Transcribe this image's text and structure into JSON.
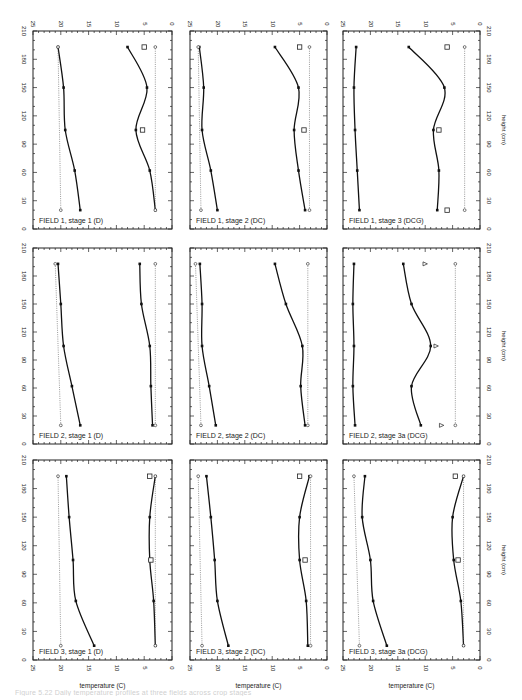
{
  "figure": {
    "caption": "Figure 5.22 Daily temperature profiles at three fields across crop stages",
    "orientation": "rotated 90° counter-clockwise",
    "axes": {
      "temperature_label": "temperature (C)",
      "height_label": "height (cm)",
      "temperature_ticks": [
        25,
        20,
        15,
        10,
        5,
        0
      ],
      "height_ticks": [
        0,
        30,
        60,
        90,
        120,
        150,
        180,
        210
      ]
    }
  },
  "chart_data": [
    {
      "type": "line",
      "title": "FIELD 1, stage 1 (D)",
      "xlabel": "height (cm)",
      "ylabel": "temperature (C)",
      "xlim": [
        0,
        210
      ],
      "ylim": [
        0,
        25
      ],
      "series": [
        {
          "name": "upper profile",
          "x": [
            20,
            62,
            105,
            150,
            193
          ],
          "y": [
            16.5,
            17.5,
            19.2,
            19.5,
            20.5
          ]
        },
        {
          "name": "lower profile",
          "x": [
            20,
            62,
            105,
            150,
            193
          ],
          "y": [
            3.0,
            4.0,
            6.5,
            4.5,
            8.0
          ]
        },
        {
          "name": "reference upper (dotted)",
          "x": [
            20,
            193
          ],
          "y": [
            20.0,
            20.5
          ]
        },
        {
          "name": "reference lower (dotted)",
          "x": [
            20,
            193
          ],
          "y": [
            3.0,
            3.0
          ]
        }
      ],
      "markers": [
        {
          "x": 193,
          "y": 5.0,
          "symbol": "square"
        },
        {
          "x": 105,
          "y": 5.3,
          "symbol": "square"
        }
      ]
    },
    {
      "type": "line",
      "title": "FIELD 1, stage 2 (DC)",
      "xlabel": "height (cm)",
      "ylabel": "temperature (C)",
      "xlim": [
        0,
        210
      ],
      "ylim": [
        0,
        25
      ],
      "series": [
        {
          "name": "upper profile",
          "x": [
            20,
            62,
            105,
            150,
            193
          ],
          "y": [
            20.0,
            21.2,
            22.8,
            22.5,
            23.3
          ]
        },
        {
          "name": "lower profile",
          "x": [
            20,
            62,
            105,
            150,
            193
          ],
          "y": [
            4.0,
            5.2,
            6.0,
            5.2,
            9.5
          ]
        },
        {
          "name": "reference upper (dotted)",
          "x": [
            20,
            193
          ],
          "y": [
            23.0,
            23.5
          ]
        },
        {
          "name": "reference lower (dotted)",
          "x": [
            20,
            193
          ],
          "y": [
            3.2,
            3.2
          ]
        }
      ],
      "markers": [
        {
          "x": 193,
          "y": 5.0,
          "symbol": "square"
        },
        {
          "x": 105,
          "y": 4.2,
          "symbol": "square"
        }
      ]
    },
    {
      "type": "line",
      "title": "FIELD 1, stage 3 (DCG)",
      "xlabel": "height (cm)",
      "ylabel": "temperature (C)",
      "xlim": [
        0,
        210
      ],
      "ylim": [
        0,
        25
      ],
      "series": [
        {
          "name": "upper profile",
          "x": [
            20,
            62,
            105,
            150,
            193
          ],
          "y": [
            22.0,
            22.4,
            22.8,
            23.0,
            22.6
          ]
        },
        {
          "name": "lower profile",
          "x": [
            20,
            62,
            105,
            150,
            193
          ],
          "y": [
            7.8,
            7.5,
            8.5,
            6.5,
            13.0
          ]
        },
        {
          "name": "reference lower (dotted)",
          "x": [
            20,
            193
          ],
          "y": [
            2.8,
            2.8
          ]
        }
      ],
      "markers": [
        {
          "x": 193,
          "y": 6.0,
          "symbol": "square"
        },
        {
          "x": 105,
          "y": 7.5,
          "symbol": "square"
        },
        {
          "x": 20,
          "y": 6.0,
          "symbol": "square"
        }
      ]
    },
    {
      "type": "line",
      "title": "FIELD 2, stage 1 (D)",
      "xlabel": "height (cm)",
      "ylabel": "temperature (C)",
      "xlim": [
        0,
        210
      ],
      "ylim": [
        0,
        25
      ],
      "series": [
        {
          "name": "upper profile",
          "x": [
            20,
            62,
            105,
            150,
            193
          ],
          "y": [
            16.5,
            18.0,
            19.5,
            20.0,
            20.5
          ]
        },
        {
          "name": "lower profile",
          "x": [
            20,
            62,
            105,
            150,
            193
          ],
          "y": [
            3.5,
            3.8,
            4.0,
            5.5,
            5.8
          ]
        },
        {
          "name": "reference upper (dotted)",
          "x": [
            20,
            193
          ],
          "y": [
            20.0,
            21.0
          ]
        },
        {
          "name": "reference lower (dotted)",
          "x": [
            20,
            193
          ],
          "y": [
            3.0,
            3.0
          ]
        }
      ]
    },
    {
      "type": "line",
      "title": "FIELD 2, stage 2 (DC)",
      "xlabel": "height (cm)",
      "ylabel": "temperature (C)",
      "xlim": [
        0,
        210
      ],
      "ylim": [
        0,
        25
      ],
      "series": [
        {
          "name": "upper profile",
          "x": [
            20,
            62,
            105,
            150,
            193
          ],
          "y": [
            20.3,
            21.5,
            22.8,
            22.8,
            23.2
          ]
        },
        {
          "name": "lower profile",
          "x": [
            20,
            62,
            105,
            150,
            193
          ],
          "y": [
            4.0,
            4.8,
            4.5,
            7.5,
            9.5
          ]
        },
        {
          "name": "reference upper (dotted)",
          "x": [
            20,
            193
          ],
          "y": [
            23.0,
            24.0
          ]
        },
        {
          "name": "reference lower (dotted)",
          "x": [
            20,
            193
          ],
          "y": [
            3.5,
            3.5
          ]
        }
      ]
    },
    {
      "type": "line",
      "title": "FIELD 2, stage 3a (DCG)",
      "xlabel": "height (cm)",
      "ylabel": "temperature (C)",
      "xlim": [
        0,
        210
      ],
      "ylim": [
        0,
        25
      ],
      "series": [
        {
          "name": "upper profile",
          "x": [
            20,
            62,
            105,
            150,
            193
          ],
          "y": [
            22.8,
            23.2,
            23.0,
            23.2,
            23.0
          ]
        },
        {
          "name": "lower profile",
          "x": [
            20,
            62,
            105,
            150,
            193
          ],
          "y": [
            10.8,
            12.5,
            9.0,
            12.5,
            14.0
          ]
        },
        {
          "name": "reference lower (dotted)",
          "x": [
            20,
            193
          ],
          "y": [
            4.5,
            4.5
          ]
        }
      ],
      "markers": [
        {
          "x": 193,
          "y": 10.0,
          "symbol": "triangle"
        },
        {
          "x": 105,
          "y": 8.0,
          "symbol": "triangle"
        },
        {
          "x": 20,
          "y": 7.0,
          "symbol": "triangle"
        }
      ]
    },
    {
      "type": "line",
      "title": "FIELD 3, stage 1 (D)",
      "xlabel": "height (cm)",
      "ylabel": "temperature (C)",
      "xlim": [
        0,
        210
      ],
      "ylim": [
        0,
        25
      ],
      "series": [
        {
          "name": "upper profile",
          "x": [
            15,
            62,
            105,
            150,
            193
          ],
          "y": [
            14.0,
            17.3,
            17.8,
            18.5,
            19.0
          ]
        },
        {
          "name": "lower profile",
          "x": [
            15,
            62,
            105,
            150,
            193
          ],
          "y": [
            3.0,
            3.3,
            4.0,
            4.0,
            3.0
          ]
        },
        {
          "name": "reference upper (dotted)",
          "x": [
            15,
            193
          ],
          "y": [
            20.0,
            20.5
          ]
        },
        {
          "name": "reference lower (dotted)",
          "x": [
            15,
            193
          ],
          "y": [
            3.0,
            3.0
          ]
        }
      ],
      "markers": [
        {
          "x": 193,
          "y": 4.0,
          "symbol": "square"
        },
        {
          "x": 105,
          "y": 3.8,
          "symbol": "square"
        }
      ]
    },
    {
      "type": "line",
      "title": "FIELD 3, stage 2 (DC)",
      "xlabel": "height (cm)",
      "ylabel": "temperature (C)",
      "xlim": [
        0,
        210
      ],
      "ylim": [
        0,
        25
      ],
      "series": [
        {
          "name": "upper profile",
          "x": [
            15,
            62,
            105,
            150,
            193
          ],
          "y": [
            18.0,
            20.0,
            20.5,
            21.2,
            22.0
          ]
        },
        {
          "name": "lower profile",
          "x": [
            15,
            62,
            105,
            150,
            193
          ],
          "y": [
            3.5,
            3.8,
            5.0,
            5.0,
            3.2
          ]
        },
        {
          "name": "reference upper (dotted)",
          "x": [
            15,
            193
          ],
          "y": [
            22.8,
            23.5
          ]
        },
        {
          "name": "reference lower (dotted)",
          "x": [
            15,
            193
          ],
          "y": [
            3.0,
            3.0
          ]
        }
      ],
      "markers": [
        {
          "x": 193,
          "y": 5.0,
          "symbol": "square"
        },
        {
          "x": 105,
          "y": 4.0,
          "symbol": "square"
        }
      ]
    },
    {
      "type": "line",
      "title": "FIELD 3, stage 3a (DCG)",
      "xlabel": "height (cm)",
      "ylabel": "temperature (C)",
      "xlim": [
        0,
        210
      ],
      "ylim": [
        0,
        25
      ],
      "series": [
        {
          "name": "upper profile",
          "x": [
            15,
            62,
            105,
            150,
            193
          ],
          "y": [
            17.0,
            19.5,
            20.0,
            21.5,
            21.0
          ]
        },
        {
          "name": "lower profile",
          "x": [
            15,
            62,
            105,
            150,
            193
          ],
          "y": [
            3.0,
            3.5,
            4.8,
            5.0,
            3.0
          ]
        },
        {
          "name": "reference upper (dotted)",
          "x": [
            15,
            193
          ],
          "y": [
            22.0,
            23.0
          ]
        },
        {
          "name": "reference lower (dotted)",
          "x": [
            15,
            193
          ],
          "y": [
            3.0,
            3.0
          ]
        }
      ],
      "markers": [
        {
          "x": 193,
          "y": 4.5,
          "symbol": "square"
        },
        {
          "x": 105,
          "y": 4.0,
          "symbol": "square"
        }
      ]
    }
  ]
}
